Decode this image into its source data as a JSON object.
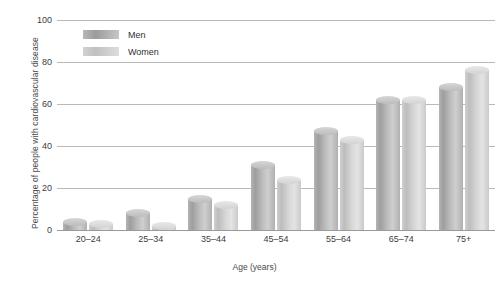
{
  "chart_data": {
    "type": "bar",
    "title": "",
    "xlabel": "Age (years)",
    "ylabel": "Percentage of people with cardiovascular disease",
    "categories": [
      "20–24",
      "25–34",
      "35–44",
      "45–54",
      "55–64",
      "65–74",
      "75+"
    ],
    "series": [
      {
        "name": "Men",
        "color": "#a8a8a8",
        "values": [
          4,
          8,
          15,
          31,
          47,
          62,
          68
        ]
      },
      {
        "name": "Women",
        "color": "#cfcfcf",
        "values": [
          3,
          2,
          12,
          24,
          43,
          62,
          76
        ]
      }
    ],
    "ylim": [
      0,
      100
    ],
    "yticks": [
      0,
      20,
      40,
      60,
      80,
      100
    ],
    "ytick_labels": [
      "0",
      "20",
      "40",
      "60",
      "80",
      "100"
    ],
    "grid": true,
    "legend_position": "top-left-inside"
  }
}
